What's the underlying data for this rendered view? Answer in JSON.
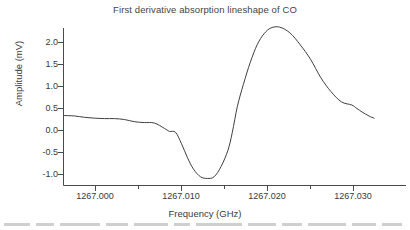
{
  "chart_data": {
    "type": "line",
    "title": "First derivative absorption lineshape of CO",
    "xlabel": "Frequency (GHz)",
    "ylabel": "Amplitude (mV)",
    "xlim": [
      1266.9964,
      1267.0324
    ],
    "ylim": [
      -1.18,
      2.42
    ],
    "xticks": [
      1267.0,
      1267.01,
      1267.02,
      1267.03
    ],
    "xtick_labels": [
      "1267.000",
      "1267.010",
      "1267.020",
      "1267.030"
    ],
    "xminor_ticks": [
      1267.005,
      1267.015,
      1267.025
    ],
    "yticks": [
      -1.0,
      -0.5,
      0.0,
      0.5,
      1.0,
      1.5,
      2.0
    ],
    "ytick_labels": [
      "-1.0",
      "-0.5",
      "0.0",
      "0.5",
      "1.0",
      "1.5",
      "2.0"
    ],
    "grid": false,
    "legend": null,
    "series": [
      {
        "name": "CO first derivative signal",
        "x": [
          1266.9964,
          1266.99756,
          1266.99872,
          1266.99988,
          1267.00104,
          1267.0022,
          1267.00336,
          1267.00452,
          1267.00568,
          1267.00684,
          1267.008,
          1267.0086,
          1267.0093,
          1267.01,
          1267.0107,
          1267.0114,
          1267.0122,
          1267.013,
          1267.0138,
          1267.0146,
          1267.0154,
          1267.0159,
          1267.0165,
          1267.0172,
          1267.018,
          1267.0188,
          1267.0196,
          1267.0204,
          1267.0214,
          1267.0226,
          1267.0238,
          1267.025,
          1267.0262,
          1267.0274,
          1267.0286,
          1267.0298,
          1267.0304,
          1267.031,
          1267.0318,
          1267.0324
        ],
        "y": [
          0.34,
          0.33,
          0.3,
          0.28,
          0.27,
          0.27,
          0.25,
          0.2,
          0.18,
          0.17,
          0.05,
          -0.02,
          -0.04,
          -0.3,
          -0.62,
          -0.88,
          -1.05,
          -1.09,
          -1.05,
          -0.82,
          -0.45,
          -0.05,
          0.55,
          1.05,
          1.55,
          1.95,
          2.2,
          2.33,
          2.35,
          2.22,
          1.95,
          1.62,
          1.2,
          0.88,
          0.65,
          0.58,
          0.5,
          0.42,
          0.33,
          0.28
        ],
        "color": "#3f3f3f"
      }
    ],
    "annotations": {
      "peak_amplitude_mV": 2.35,
      "peak_frequency_GHz": 1267.0159,
      "trough_amplitude_mV": -1.09,
      "trough_frequency_GHz": 1267.01,
      "zero_crossing_frequency_GHz": 1267.0129
    }
  }
}
